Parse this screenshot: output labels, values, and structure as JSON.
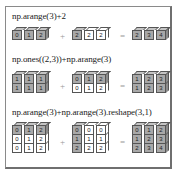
{
  "figure": {
    "operators": {
      "plus": "+",
      "equals": "="
    },
    "colors": {
      "filled": "#a8a8a8",
      "broadcast": "#ffffff",
      "border": "#555555"
    },
    "examples": [
      {
        "label": "np.arange(3)+2",
        "left": {
          "rows": [
            [
              {
                "v": "0",
                "t": "g"
              },
              {
                "v": "1",
                "t": "g"
              },
              {
                "v": "2",
                "t": "g"
              }
            ]
          ]
        },
        "middle": {
          "rows": [
            [
              {
                "v": "2",
                "t": "g"
              },
              {
                "v": "2",
                "t": "w"
              },
              {
                "v": "2",
                "t": "w"
              }
            ]
          ]
        },
        "result": {
          "rows": [
            [
              {
                "v": "2",
                "t": "g"
              },
              {
                "v": "3",
                "t": "g"
              },
              {
                "v": "4",
                "t": "g"
              }
            ]
          ]
        }
      },
      {
        "label": "np.ones((2,3))+np.arange(3)",
        "left": {
          "rows": [
            [
              {
                "v": "1",
                "t": "g"
              },
              {
                "v": "1",
                "t": "g"
              },
              {
                "v": "1",
                "t": "g"
              }
            ],
            [
              {
                "v": "1",
                "t": "g"
              },
              {
                "v": "1",
                "t": "g"
              },
              {
                "v": "1",
                "t": "g"
              }
            ]
          ]
        },
        "middle": {
          "rows": [
            [
              {
                "v": "0",
                "t": "g"
              },
              {
                "v": "1",
                "t": "g"
              },
              {
                "v": "2",
                "t": "g"
              }
            ],
            [
              {
                "v": "0",
                "t": "w"
              },
              {
                "v": "1",
                "t": "w"
              },
              {
                "v": "2",
                "t": "w"
              }
            ]
          ]
        },
        "result": {
          "rows": [
            [
              {
                "v": "1",
                "t": "g"
              },
              {
                "v": "2",
                "t": "g"
              },
              {
                "v": "3",
                "t": "g"
              }
            ],
            [
              {
                "v": "1",
                "t": "g"
              },
              {
                "v": "2",
                "t": "g"
              },
              {
                "v": "3",
                "t": "g"
              }
            ]
          ]
        }
      },
      {
        "label": "np.arange(3)+np.arange(3).reshape(3,1)",
        "left": {
          "rows": [
            [
              {
                "v": "0",
                "t": "g"
              },
              {
                "v": "1",
                "t": "g"
              },
              {
                "v": "2",
                "t": "g"
              }
            ],
            [
              {
                "v": "0",
                "t": "w"
              },
              {
                "v": "1",
                "t": "w"
              },
              {
                "v": "2",
                "t": "w"
              }
            ],
            [
              {
                "v": "0",
                "t": "w"
              },
              {
                "v": "1",
                "t": "w"
              },
              {
                "v": "2",
                "t": "w"
              }
            ]
          ]
        },
        "middle": {
          "rows": [
            [
              {
                "v": "0",
                "t": "g"
              },
              {
                "v": "0",
                "t": "w"
              },
              {
                "v": "0",
                "t": "w"
              }
            ],
            [
              {
                "v": "1",
                "t": "g"
              },
              {
                "v": "1",
                "t": "w"
              },
              {
                "v": "1",
                "t": "w"
              }
            ],
            [
              {
                "v": "2",
                "t": "g"
              },
              {
                "v": "2",
                "t": "w"
              },
              {
                "v": "2",
                "t": "w"
              }
            ]
          ]
        },
        "result": {
          "rows": [
            [
              {
                "v": "0",
                "t": "g"
              },
              {
                "v": "1",
                "t": "g"
              },
              {
                "v": "2",
                "t": "g"
              }
            ],
            [
              {
                "v": "1",
                "t": "g"
              },
              {
                "v": "2",
                "t": "g"
              },
              {
                "v": "3",
                "t": "g"
              }
            ],
            [
              {
                "v": "2",
                "t": "g"
              },
              {
                "v": "3",
                "t": "g"
              },
              {
                "v": "4",
                "t": "g"
              }
            ]
          ]
        }
      }
    ]
  }
}
